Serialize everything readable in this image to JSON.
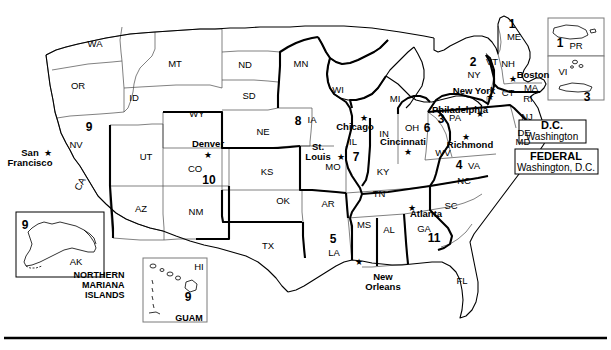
{
  "map": {
    "states": [
      {
        "abbr": "WA",
        "x": 95,
        "y": 44
      },
      {
        "abbr": "OR",
        "x": 78,
        "y": 86
      },
      {
        "abbr": "ID",
        "x": 134,
        "y": 98
      },
      {
        "abbr": "MT",
        "x": 175,
        "y": 64
      },
      {
        "abbr": "ND",
        "x": 245,
        "y": 65
      },
      {
        "abbr": "SD",
        "x": 249,
        "y": 96
      },
      {
        "abbr": "NE",
        "x": 263,
        "y": 132
      },
      {
        "abbr": "MN",
        "x": 301,
        "y": 64
      },
      {
        "abbr": "IA",
        "x": 312,
        "y": 120
      },
      {
        "abbr": "WI",
        "x": 338,
        "y": 90
      },
      {
        "abbr": "MI",
        "x": 395,
        "y": 99
      },
      {
        "abbr": "WY",
        "x": 197,
        "y": 114
      },
      {
        "abbr": "NV",
        "x": 76,
        "y": 145
      },
      {
        "abbr": "UT",
        "x": 146,
        "y": 157
      },
      {
        "abbr": "CO",
        "x": 195,
        "y": 169
      },
      {
        "abbr": "KS",
        "x": 267,
        "y": 172
      },
      {
        "abbr": "MO",
        "x": 333,
        "y": 167
      },
      {
        "abbr": "IL",
        "x": 353,
        "y": 142
      },
      {
        "abbr": "IN",
        "x": 384,
        "y": 134
      },
      {
        "abbr": "OH",
        "x": 412,
        "y": 128
      },
      {
        "abbr": "KY",
        "x": 383,
        "y": 172
      },
      {
        "abbr": "CA",
        "x": 80,
        "y": 184
      },
      {
        "abbr": "AZ",
        "x": 141,
        "y": 209
      },
      {
        "abbr": "NM",
        "x": 196,
        "y": 212
      },
      {
        "abbr": "OK",
        "x": 283,
        "y": 201
      },
      {
        "abbr": "TX",
        "x": 268,
        "y": 246
      },
      {
        "abbr": "AR",
        "x": 328,
        "y": 204
      },
      {
        "abbr": "TN",
        "x": 379,
        "y": 194
      },
      {
        "abbr": "MS",
        "x": 364,
        "y": 225
      },
      {
        "abbr": "AL",
        "x": 389,
        "y": 230
      },
      {
        "abbr": "GA",
        "x": 424,
        "y": 229
      },
      {
        "abbr": "SC",
        "x": 451,
        "y": 206
      },
      {
        "abbr": "NC",
        "x": 464,
        "y": 181
      },
      {
        "abbr": "LA",
        "x": 334,
        "y": 253
      },
      {
        "abbr": "FL",
        "x": 462,
        "y": 281
      },
      {
        "abbr": "VA",
        "x": 474,
        "y": 166
      },
      {
        "abbr": "WV",
        "x": 443,
        "y": 153
      },
      {
        "abbr": "PA",
        "x": 455,
        "y": 118
      },
      {
        "abbr": "NY",
        "x": 474,
        "y": 75
      },
      {
        "abbr": "ME",
        "x": 514,
        "y": 37
      },
      {
        "abbr": "VT",
        "x": 492,
        "y": 62
      },
      {
        "abbr": "NH",
        "x": 508,
        "y": 64
      },
      {
        "abbr": "MA",
        "x": 531,
        "y": 88
      },
      {
        "abbr": "RI",
        "x": 528,
        "y": 99
      },
      {
        "abbr": "CT",
        "x": 508,
        "y": 93
      },
      {
        "abbr": "NJ",
        "x": 527,
        "y": 117
      },
      {
        "abbr": "DE",
        "x": 524,
        "y": 133
      },
      {
        "abbr": "MD",
        "x": 523,
        "y": 142
      },
      {
        "abbr": "AK",
        "x": 76,
        "y": 262
      },
      {
        "abbr": "HI",
        "x": 199,
        "y": 267
      },
      {
        "abbr": "PR",
        "x": 576,
        "y": 46
      },
      {
        "abbr": "VI",
        "x": 563,
        "y": 72
      }
    ],
    "circuits": [
      {
        "number": "1",
        "x": 512,
        "y": 24
      },
      {
        "number": "2",
        "x": 473,
        "y": 62
      },
      {
        "number": "3",
        "x": 441,
        "y": 119
      },
      {
        "number": "4",
        "x": 459,
        "y": 165
      },
      {
        "number": "5",
        "x": 333,
        "y": 239
      },
      {
        "number": "6",
        "x": 427,
        "y": 128
      },
      {
        "number": "7",
        "x": 356,
        "y": 157
      },
      {
        "number": "8",
        "x": 298,
        "y": 121
      },
      {
        "number": "9",
        "x": 89,
        "y": 127
      },
      {
        "number": "9",
        "x": 25,
        "y": 225
      },
      {
        "number": "9",
        "x": 188,
        "y": 297
      },
      {
        "number": "10",
        "x": 209,
        "y": 180
      },
      {
        "number": "11",
        "x": 434,
        "y": 238
      },
      {
        "number": "1",
        "x": 560,
        "y": 43
      },
      {
        "number": "3",
        "x": 587,
        "y": 97
      }
    ],
    "cities": [
      {
        "name": "San\nFrancisco",
        "x": 30,
        "y": 158,
        "star_x": 48,
        "star_y": 153,
        "multiline": true
      },
      {
        "name": "Denver",
        "x": 208,
        "y": 144,
        "star_x": 208,
        "star_y": 155,
        "multiline": false
      },
      {
        "name": "St.\nLouis",
        "x": 318,
        "y": 152,
        "star_x": 341,
        "star_y": 157,
        "multiline": true
      },
      {
        "name": "Chicago",
        "x": 355,
        "y": 127,
        "star_x": 364,
        "star_y": 118,
        "multiline": false
      },
      {
        "name": "Cincinnati",
        "x": 403,
        "y": 142,
        "star_x": 408,
        "star_y": 152,
        "multiline": false
      },
      {
        "name": "Richmond",
        "x": 470,
        "y": 145,
        "star_x": 466,
        "star_y": 137,
        "multiline": false
      },
      {
        "name": "Philadelphia",
        "x": 460,
        "y": 110,
        "star_x": 480,
        "star_y": 114,
        "multiline": false
      },
      {
        "name": "New York",
        "x": 474,
        "y": 91,
        "star_x": 490,
        "star_y": 97,
        "multiline": false
      },
      {
        "name": "Boston",
        "x": 533,
        "y": 75,
        "star_x": 513,
        "star_y": 79,
        "multiline": false
      },
      {
        "name": "Atlanta",
        "x": 426,
        "y": 214,
        "star_x": 412,
        "star_y": 208,
        "multiline": false
      },
      {
        "name": "New\nOrleans",
        "x": 383,
        "y": 282,
        "star_x": 359,
        "star_y": 262,
        "multiline": true
      }
    ],
    "territory_labels": [
      {
        "text": "NORTHERN\nMARIANA\nISLANDS",
        "x": 99,
        "y": 285
      },
      {
        "text": "GUAM",
        "x": 189,
        "y": 318
      }
    ],
    "boxes": [
      {
        "id": "dc-box",
        "title": "D.C.",
        "subtitle": "Washington",
        "x": 552,
        "y": 131
      },
      {
        "id": "federal-box",
        "title": "FEDERAL",
        "subtitle": "Washington, D.C.",
        "x": 556,
        "y": 162
      }
    ],
    "colors": {
      "outline": "#000000",
      "background": "#ffffff",
      "state_border": "#555555",
      "circuit_border": "#000000"
    }
  }
}
